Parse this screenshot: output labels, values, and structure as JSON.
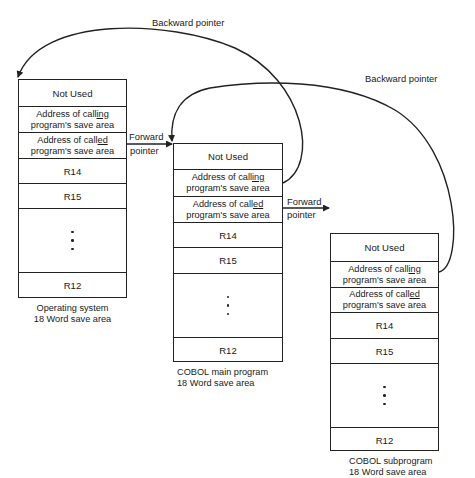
{
  "diagram": {
    "type": "linked save areas",
    "save_areas": [
      {
        "id": "os",
        "caption_line1": "Operating system",
        "caption_line2": "18 Word save area",
        "rows": {
          "not_used": "Not Used",
          "calling_prefix": "Address of call",
          "calling_ul": "ing",
          "calling_line2": "program's save area",
          "called_prefix": "Address of call",
          "called_ul": "ed",
          "called_line2": "program's save area",
          "r14": "R14",
          "r15": "R15",
          "r12": "R12"
        }
      },
      {
        "id": "main",
        "caption_line1": "COBOL main program",
        "caption_line2": "18 Word save area",
        "rows": {
          "not_used": "Not Used",
          "calling_prefix": "Address of call",
          "calling_ul": "ing",
          "calling_line2": "program's save area",
          "called_prefix": "Address of call",
          "called_ul": "ed",
          "called_line2": "program's save area",
          "r14": "R14",
          "r15": "R15",
          "r12": "R12"
        }
      },
      {
        "id": "sub",
        "caption_line1": "COBOL subprogram",
        "caption_line2": "18 Word save area",
        "rows": {
          "not_used": "Not Used",
          "calling_prefix": "Address of call",
          "calling_ul": "ing",
          "calling_line2": "program's save area",
          "called_prefix": "Address of call",
          "called_ul": "ed",
          "called_line2": "program's save area",
          "r14": "R14",
          "r15": "R15",
          "r12": "R12"
        }
      }
    ],
    "pointers": {
      "backward_1": "Backward pointer",
      "backward_2": "Backward pointer",
      "forward_1_line1": "Forward",
      "forward_1_line2": "pointer",
      "forward_2_line1": "Forward",
      "forward_2_line2": "pointer"
    },
    "colors": {
      "line": "#222222",
      "background": "#ffffff"
    }
  }
}
